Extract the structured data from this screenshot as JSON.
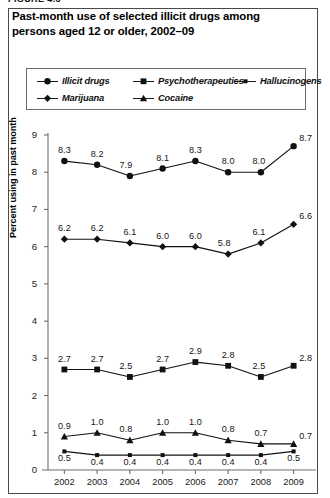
{
  "figure": {
    "number_label": "FIGURE 4.3"
  },
  "title": "Past-month use of selected illicit drugs among persons aged 12 or older, 2002–09",
  "legend": {
    "entries": [
      {
        "label": "Illicit drugs",
        "marker": "circle"
      },
      {
        "label": "Psychotherapeutics",
        "marker": "square"
      },
      {
        "label": "Hallucinogens",
        "marker": "small-square"
      },
      {
        "label": "Marijuana",
        "marker": "diamond"
      },
      {
        "label": "Cocaine",
        "marker": "triangle"
      }
    ]
  },
  "axes": {
    "ylabel": "Percent using in past month",
    "yticks": [
      "0",
      "1",
      "2",
      "3",
      "4",
      "5",
      "6",
      "7",
      "8",
      "9"
    ],
    "xticks": [
      "2002",
      "2003",
      "2004",
      "2005",
      "2006",
      "2007",
      "2008",
      "2009"
    ]
  },
  "chart_data": {
    "type": "line",
    "title": "Past-month use of selected illicit drugs among persons aged 12 or older, 2002–09",
    "xlabel": "",
    "ylabel": "Percent using in past month",
    "categories": [
      "2002",
      "2003",
      "2004",
      "2005",
      "2006",
      "2007",
      "2008",
      "2009"
    ],
    "ylim": [
      0,
      9
    ],
    "ytick_step": 1,
    "grid": false,
    "legend_position": "top",
    "data_labels": true,
    "series": [
      {
        "name": "Illicit drugs",
        "marker": "circle",
        "values": [
          8.3,
          8.2,
          7.9,
          8.1,
          8.3,
          8.0,
          8.0,
          8.7
        ],
        "labels": [
          "8.3",
          "8.2",
          "7.9",
          "8.1",
          "8.3",
          "8.0",
          "8.0",
          "8.7"
        ]
      },
      {
        "name": "Marijuana",
        "marker": "diamond",
        "values": [
          6.2,
          6.2,
          6.1,
          6.0,
          6.0,
          5.8,
          6.1,
          6.6
        ],
        "labels": [
          "6.2",
          "6.2",
          "6.1",
          "6.0",
          "6.0",
          "5.8",
          "6.1",
          "6.6"
        ]
      },
      {
        "name": "Psychotherapeutics",
        "marker": "square",
        "values": [
          2.7,
          2.7,
          2.5,
          2.7,
          2.9,
          2.8,
          2.5,
          2.8
        ],
        "labels": [
          "2.7",
          "2.7",
          "2.5",
          "2.7",
          "2.9",
          "2.8",
          "2.5",
          "2.8"
        ]
      },
      {
        "name": "Cocaine",
        "marker": "triangle",
        "values": [
          0.9,
          1.0,
          0.8,
          1.0,
          1.0,
          0.8,
          0.7,
          0.7
        ],
        "labels": [
          "0.9",
          "1.0",
          "0.8",
          "1.0",
          "1.0",
          "0.8",
          "0.7",
          "0.7"
        ]
      },
      {
        "name": "Hallucinogens",
        "marker": "small-square",
        "values": [
          0.5,
          0.4,
          0.4,
          0.4,
          0.4,
          0.4,
          0.4,
          0.5
        ],
        "labels": [
          "0.5",
          "0.4",
          "0.4",
          "0.4",
          "0.4",
          "0.4",
          "0.4",
          "0.5"
        ]
      }
    ]
  },
  "colors": {
    "ink": "#111111",
    "frame": "#4a4a4a",
    "axis": "#6d6d6d"
  }
}
